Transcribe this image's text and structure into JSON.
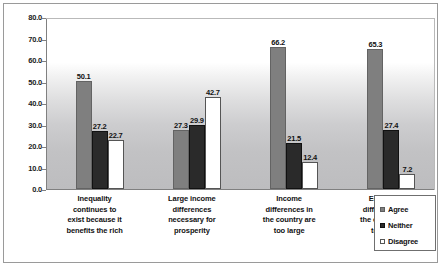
{
  "chart_data": {
    "type": "bar",
    "title": "",
    "subtitle": "",
    "xlabel": "",
    "ylabel": "",
    "ylim": [
      0.0,
      80.0
    ],
    "ystep": 10.0,
    "grid": false,
    "legend_position": "bottom-right",
    "ytick_labels": [
      "80.0",
      "70.0",
      "60.0",
      "50.0",
      "40.0",
      "30.0",
      "20.0",
      "10.0",
      "0.0"
    ],
    "categories": [
      "Inequality continues to exist because it benefits the rich",
      "Large income differences necessary for prosperity",
      "Income differences in the country are too large",
      "Economic differences in the country are too large"
    ],
    "category_lines": [
      [
        "Inequality",
        "continues to",
        "exist because it",
        "benefits the rich"
      ],
      [
        "Large income",
        "differences",
        "necessary for",
        "prosperity"
      ],
      [
        "Income",
        "differences in",
        "the country are",
        "too large"
      ],
      [
        "Economic",
        "differences in",
        "the country are",
        "too large"
      ]
    ],
    "series": [
      {
        "name": "Agree",
        "color": "#7f7f7f",
        "values": [
          50.1,
          27.3,
          66.2,
          65.3
        ]
      },
      {
        "name": "Neither",
        "color": "#2a2a2a",
        "values": [
          27.2,
          29.9,
          21.5,
          27.4
        ]
      },
      {
        "name": "Disagree",
        "color": "#ffffff",
        "values": [
          22.7,
          42.7,
          12.4,
          7.2
        ]
      }
    ],
    "value_labels": [
      [
        "50.1",
        "27.2",
        "22.7"
      ],
      [
        "27.3",
        "29.9",
        "42.7"
      ],
      [
        "66.2",
        "21.5",
        "12.4"
      ],
      [
        "65.3",
        "27.4",
        "7.2"
      ]
    ]
  }
}
